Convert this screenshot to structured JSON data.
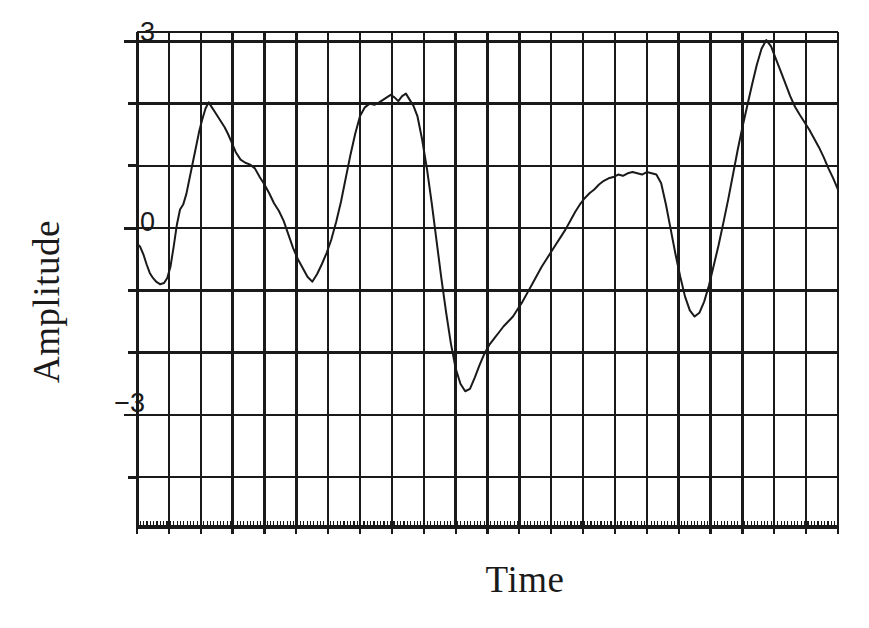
{
  "figure": {
    "title": "",
    "background_color": "#ffffff",
    "ink_color": "#1a1a1a"
  },
  "axis": {
    "ylabel": "Amplitude",
    "xlabel": "Time",
    "ytick_labels": [
      "3",
      "0",
      "−3"
    ],
    "ytick_values": [
      3,
      0,
      -3
    ]
  },
  "chart_data": {
    "type": "line",
    "title": "",
    "xlabel": "Time",
    "ylabel": "Amplitude",
    "xlim": [
      0,
      22
    ],
    "ylim": [
      -4.8,
      3.15
    ],
    "yticks": [
      3,
      0,
      -3
    ],
    "ytick_labels": [
      "3",
      "0",
      "−3"
    ],
    "xticks": [],
    "xtick_labels": [],
    "grid": true,
    "grid_spacing_y": 1,
    "grid_spacing_x": 1,
    "legend": false,
    "legend_position": "none",
    "annotations": [],
    "series": [
      {
        "name": "signal",
        "color": "#1a1a1a",
        "line_width": 2,
        "x": [
          0.0,
          0.1,
          0.2,
          0.3,
          0.4,
          0.5,
          0.6,
          0.72,
          0.85,
          0.95,
          1.05,
          1.15,
          1.25,
          1.35,
          1.45,
          1.55,
          1.65,
          1.75,
          1.85,
          1.95,
          2.05,
          2.15,
          2.25,
          2.35,
          2.45,
          2.55,
          2.65,
          2.75,
          2.85,
          2.95,
          3.1,
          3.25,
          3.4,
          3.55,
          3.7,
          3.85,
          4.0,
          4.15,
          4.3,
          4.45,
          4.6,
          4.75,
          4.9,
          5.05,
          5.2,
          5.35,
          5.5,
          5.65,
          5.8,
          5.95,
          6.1,
          6.25,
          6.4,
          6.55,
          6.7,
          6.85,
          7.0,
          7.15,
          7.3,
          7.45,
          7.6,
          7.72,
          7.84,
          7.96,
          8.08,
          8.2,
          8.32,
          8.44,
          8.56,
          8.68,
          8.8,
          8.95,
          9.1,
          9.25,
          9.4,
          9.55,
          9.7,
          9.85,
          10.0,
          10.15,
          10.3,
          10.45,
          10.6,
          10.75,
          10.9,
          11.05,
          11.2,
          11.35,
          11.5,
          11.65,
          11.8,
          11.95,
          12.1,
          12.25,
          12.4,
          12.55,
          12.7,
          12.85,
          13.0,
          13.15,
          13.3,
          13.45,
          13.6,
          13.75,
          13.9,
          14.05,
          14.2,
          14.35,
          14.5,
          14.65,
          14.8,
          14.95,
          15.1,
          15.25,
          15.4,
          15.55,
          15.7,
          15.85,
          16.0,
          16.15,
          16.3,
          16.45,
          16.6,
          16.75,
          16.9,
          17.05,
          17.2,
          17.35,
          17.5,
          17.65,
          17.8,
          17.95,
          18.1,
          18.25,
          18.4,
          18.55,
          18.7,
          18.85,
          19.0,
          19.15,
          19.3,
          19.45,
          19.6,
          19.75,
          19.9,
          20.05,
          20.2,
          20.35,
          20.5,
          20.65,
          20.8,
          20.95,
          21.1,
          21.25,
          21.4,
          21.55,
          21.7,
          21.85,
          22.0
        ],
        "y": [
          -0.25,
          -0.3,
          -0.42,
          -0.58,
          -0.72,
          -0.8,
          -0.86,
          -0.9,
          -0.88,
          -0.8,
          -0.62,
          -0.3,
          0.05,
          0.3,
          0.38,
          0.55,
          0.8,
          1.05,
          1.3,
          1.55,
          1.75,
          1.92,
          2.02,
          1.94,
          1.86,
          1.78,
          1.7,
          1.62,
          1.52,
          1.4,
          1.22,
          1.1,
          1.05,
          1.02,
          0.96,
          0.82,
          0.7,
          0.56,
          0.4,
          0.28,
          0.12,
          -0.1,
          -0.32,
          -0.5,
          -0.64,
          -0.78,
          -0.86,
          -0.74,
          -0.58,
          -0.4,
          -0.18,
          0.1,
          0.42,
          0.8,
          1.18,
          1.52,
          1.8,
          1.94,
          2.0,
          1.98,
          2.02,
          2.06,
          2.1,
          2.14,
          2.1,
          2.04,
          2.12,
          2.16,
          2.06,
          1.96,
          1.8,
          1.42,
          0.95,
          0.4,
          -0.2,
          -0.8,
          -1.35,
          -1.85,
          -2.25,
          -2.5,
          -2.62,
          -2.58,
          -2.4,
          -2.2,
          -2.02,
          -1.88,
          -1.78,
          -1.68,
          -1.58,
          -1.5,
          -1.42,
          -1.3,
          -1.18,
          -1.04,
          -0.9,
          -0.76,
          -0.62,
          -0.5,
          -0.38,
          -0.26,
          -0.14,
          -0.02,
          0.12,
          0.26,
          0.38,
          0.48,
          0.56,
          0.62,
          0.7,
          0.76,
          0.8,
          0.82,
          0.86,
          0.84,
          0.88,
          0.9,
          0.88,
          0.86,
          0.9,
          0.88,
          0.86,
          0.72,
          0.38,
          -0.02,
          -0.42,
          -0.78,
          -1.1,
          -1.32,
          -1.42,
          -1.36,
          -1.18,
          -0.92,
          -0.6,
          -0.28,
          0.08,
          0.45,
          0.85,
          1.25,
          1.62,
          1.96,
          2.3,
          2.62,
          2.88,
          3.02,
          2.92,
          2.72,
          2.52,
          2.32,
          2.12,
          1.95,
          1.82,
          1.7,
          1.58,
          1.44,
          1.3,
          1.14,
          0.96,
          0.8,
          0.62
        ]
      }
    ]
  }
}
